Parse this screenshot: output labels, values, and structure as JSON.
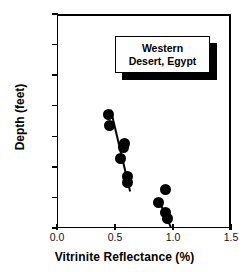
{
  "chart_data": {
    "type": "scatter",
    "title": "",
    "xlabel": "Vitrinite Reflectance (%)",
    "ylabel": "Depth (feet)",
    "xlim": [
      0.0,
      1.5
    ],
    "ylim": [
      0,
      14000
    ],
    "y_inverted": true,
    "grid": false,
    "legend_position": "top-right",
    "xticks": [
      "0.0",
      "0.5",
      "1.0",
      "1.5"
    ],
    "xtick_values": [
      0.0,
      0.5,
      1.0,
      1.5
    ],
    "yticks": [
      "0",
      "2000",
      "4000",
      "6000",
      "8000",
      "10000",
      "12000",
      "14000"
    ],
    "ytick_values": [
      0,
      2000,
      4000,
      6000,
      8000,
      10000,
      12000,
      14000
    ],
    "annotations": [
      "Western",
      "Desert, Egypt"
    ],
    "series": [
      {
        "name": "shallow-cluster",
        "marker": "filled-circle",
        "color": "#000000",
        "points": [
          {
            "x": 0.445,
            "y": 6600
          },
          {
            "x": 0.455,
            "y": 7300
          },
          {
            "x": 0.585,
            "y": 8450
          },
          {
            "x": 0.575,
            "y": 8750
          },
          {
            "x": 0.548,
            "y": 9450
          },
          {
            "x": 0.612,
            "y": 10600
          },
          {
            "x": 0.605,
            "y": 11000
          }
        ],
        "trendline": {
          "x1": 0.468,
          "y1": 6200,
          "x2": 0.635,
          "y2": 11550
        }
      },
      {
        "name": "deep-cluster",
        "marker": "filled-circle",
        "color": "#000000",
        "points": [
          {
            "x": 0.932,
            "y": 11500
          },
          {
            "x": 0.875,
            "y": 12350
          },
          {
            "x": 0.932,
            "y": 13000
          },
          {
            "x": 0.955,
            "y": 13400
          }
        ],
        "trendline": {
          "x1": 0.873,
          "y1": 11950,
          "x2": 0.985,
          "y2": 13850
        }
      }
    ]
  },
  "axis": {
    "x_label": "Vitrinite Reflectance (%)",
    "y_label": "Depth (feet)"
  },
  "legend": {
    "line1": "Western",
    "line2": "Desert, Egypt"
  }
}
